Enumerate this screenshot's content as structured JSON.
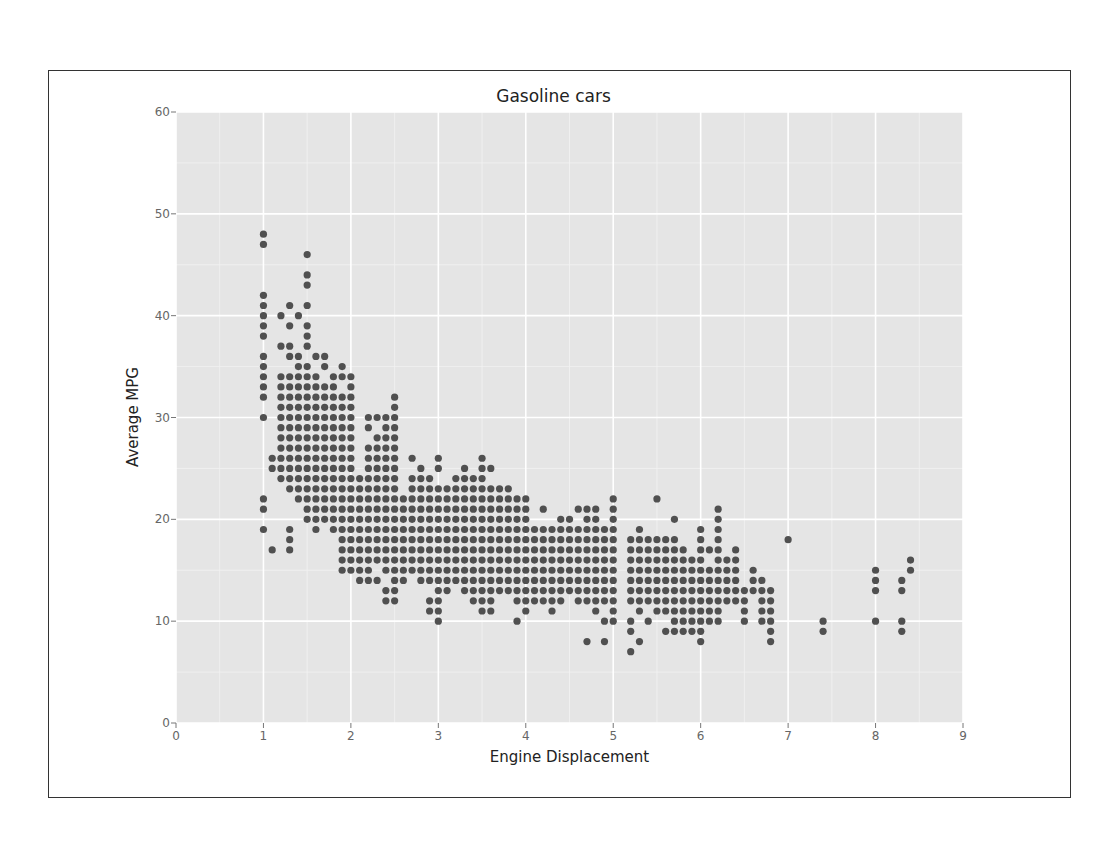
{
  "chart_data": {
    "type": "scatter",
    "title": "Gasoline cars",
    "xlabel": "Engine Displacement",
    "ylabel": "Average MPG",
    "xlim": [
      0,
      9
    ],
    "ylim": [
      0,
      60
    ],
    "xticks": [
      "0",
      "1",
      "2",
      "3",
      "4",
      "5",
      "6",
      "7",
      "8",
      "9"
    ],
    "yticks": [
      "0",
      "10",
      "20",
      "30",
      "40",
      "50",
      "60"
    ],
    "grid": true,
    "background": "#e5e5e5",
    "point_color": "#505050",
    "legend": null,
    "columns": [
      [
        1.0,
        [
          48,
          47,
          42,
          41,
          40,
          39,
          38,
          36,
          35,
          34,
          33,
          32,
          30,
          22,
          21,
          19
        ]
      ],
      [
        1.1,
        [
          26,
          25,
          17
        ]
      ],
      [
        1.2,
        [
          40,
          37,
          34,
          33,
          32,
          31,
          30,
          29,
          28,
          27,
          26,
          25,
          24
        ]
      ],
      [
        1.3,
        [
          41,
          39,
          37,
          36,
          34,
          33,
          32,
          31,
          30,
          29,
          28,
          27,
          26,
          25,
          24,
          23,
          19,
          18,
          17
        ]
      ],
      [
        1.4,
        [
          40,
          36,
          35,
          34,
          33,
          32,
          31,
          30,
          29,
          28,
          27,
          26,
          25,
          24,
          23,
          22
        ]
      ],
      [
        1.5,
        [
          46,
          44,
          43,
          41,
          39,
          38,
          37,
          35,
          34,
          33,
          32,
          31,
          30,
          29,
          28,
          27,
          26,
          25,
          24,
          23,
          22,
          21,
          20
        ]
      ],
      [
        1.6,
        [
          36,
          34,
          33,
          32,
          31,
          30,
          29,
          28,
          27,
          26,
          25,
          24,
          23,
          22,
          21,
          20,
          19
        ]
      ],
      [
        1.7,
        [
          36,
          35,
          33,
          32,
          31,
          30,
          29,
          28,
          27,
          26,
          25,
          24,
          23,
          22,
          21,
          20
        ]
      ],
      [
        1.8,
        [
          34,
          33,
          32,
          31,
          30,
          29,
          28,
          27,
          26,
          25,
          24,
          23,
          22,
          21,
          20,
          19
        ]
      ],
      [
        1.9,
        [
          35,
          34,
          32,
          31,
          30,
          29,
          28,
          27,
          26,
          25,
          24,
          23,
          22,
          21,
          20,
          19,
          18,
          17,
          16,
          15
        ]
      ],
      [
        2.0,
        [
          34,
          33,
          32,
          31,
          30,
          29,
          28,
          27,
          26,
          25,
          24,
          23,
          22,
          21,
          20,
          19,
          18,
          17,
          16,
          15
        ]
      ],
      [
        2.1,
        [
          24,
          23,
          22,
          21,
          20,
          19,
          18,
          17,
          16,
          15,
          14
        ]
      ],
      [
        2.2,
        [
          30,
          29,
          27,
          26,
          25,
          24,
          23,
          22,
          21,
          20,
          19,
          18,
          17,
          16,
          15,
          14
        ]
      ],
      [
        2.3,
        [
          30,
          28,
          27,
          26,
          25,
          24,
          23,
          22,
          21,
          20,
          19,
          18,
          17,
          16,
          14
        ]
      ],
      [
        2.4,
        [
          30,
          29,
          28,
          27,
          26,
          25,
          24,
          23,
          22,
          21,
          20,
          19,
          18,
          17,
          16,
          15,
          13,
          12
        ]
      ],
      [
        2.5,
        [
          32,
          31,
          30,
          29,
          28,
          27,
          26,
          25,
          24,
          23,
          22,
          21,
          20,
          19,
          18,
          17,
          16,
          15,
          14,
          13,
          12
        ]
      ],
      [
        2.6,
        [
          22,
          21,
          20,
          19,
          18,
          17,
          16,
          15,
          14
        ]
      ],
      [
        2.7,
        [
          26,
          24,
          23,
          22,
          21,
          20,
          19,
          18,
          17,
          16,
          15
        ]
      ],
      [
        2.8,
        [
          25,
          24,
          23,
          22,
          21,
          20,
          19,
          18,
          17,
          16,
          15,
          14
        ]
      ],
      [
        2.9,
        [
          24,
          23,
          22,
          21,
          20,
          19,
          18,
          17,
          16,
          15,
          14,
          12,
          11
        ]
      ],
      [
        3.0,
        [
          26,
          25,
          23,
          22,
          21,
          20,
          19,
          18,
          17,
          16,
          15,
          14,
          13,
          12,
          11,
          10
        ]
      ],
      [
        3.1,
        [
          23,
          22,
          21,
          20,
          19,
          18,
          17,
          16,
          15,
          14,
          13
        ]
      ],
      [
        3.2,
        [
          24,
          23,
          22,
          21,
          20,
          19,
          18,
          17,
          16,
          15,
          14
        ]
      ],
      [
        3.3,
        [
          25,
          24,
          23,
          22,
          21,
          20,
          19,
          18,
          17,
          16,
          15,
          14,
          13
        ]
      ],
      [
        3.4,
        [
          24,
          23,
          22,
          21,
          20,
          19,
          18,
          17,
          16,
          15,
          14,
          13,
          12
        ]
      ],
      [
        3.5,
        [
          26,
          25,
          24,
          23,
          22,
          21,
          20,
          19,
          18,
          17,
          16,
          15,
          14,
          13,
          12,
          11
        ]
      ],
      [
        3.6,
        [
          25,
          23,
          22,
          21,
          20,
          19,
          18,
          17,
          16,
          15,
          14,
          13,
          12,
          11
        ]
      ],
      [
        3.7,
        [
          23,
          22,
          21,
          20,
          19,
          18,
          17,
          16,
          15,
          14,
          13
        ]
      ],
      [
        3.8,
        [
          23,
          22,
          21,
          20,
          19,
          18,
          17,
          16,
          15,
          14,
          13
        ]
      ],
      [
        3.9,
        [
          22,
          21,
          20,
          19,
          18,
          17,
          16,
          15,
          14,
          13,
          12,
          10
        ]
      ],
      [
        4.0,
        [
          22,
          21,
          20,
          19,
          18,
          17,
          16,
          15,
          14,
          13,
          12,
          11
        ]
      ],
      [
        4.1,
        [
          19,
          18,
          17,
          16,
          15,
          14,
          13,
          12
        ]
      ],
      [
        4.2,
        [
          21,
          19,
          18,
          17,
          16,
          15,
          14,
          13,
          12
        ]
      ],
      [
        4.3,
        [
          19,
          18,
          17,
          16,
          15,
          14,
          13,
          12,
          11
        ]
      ],
      [
        4.4,
        [
          20,
          19,
          18,
          17,
          16,
          15,
          14,
          13,
          12
        ]
      ],
      [
        4.5,
        [
          20,
          19,
          18,
          17,
          16,
          15,
          14,
          13
        ]
      ],
      [
        4.6,
        [
          21,
          19,
          18,
          17,
          16,
          15,
          14,
          13,
          12
        ]
      ],
      [
        4.7,
        [
          21,
          20,
          19,
          18,
          17,
          16,
          15,
          14,
          13,
          12,
          8
        ]
      ],
      [
        4.8,
        [
          21,
          20,
          19,
          18,
          17,
          16,
          15,
          14,
          13,
          12,
          11
        ]
      ],
      [
        4.9,
        [
          19,
          18,
          17,
          16,
          15,
          14,
          13,
          12,
          10,
          8
        ]
      ],
      [
        5.0,
        [
          22,
          21,
          20,
          19,
          18,
          17,
          16,
          15,
          14,
          13,
          12,
          11,
          10
        ]
      ],
      [
        5.2,
        [
          18,
          17,
          16,
          15,
          14,
          13,
          12,
          10,
          9,
          7
        ]
      ],
      [
        5.3,
        [
          19,
          18,
          17,
          16,
          15,
          14,
          13,
          12,
          11,
          8
        ]
      ],
      [
        5.4,
        [
          18,
          17,
          16,
          15,
          14,
          13,
          12,
          10
        ]
      ],
      [
        5.5,
        [
          22,
          18,
          17,
          16,
          15,
          14,
          13,
          12,
          11
        ]
      ],
      [
        5.6,
        [
          18,
          17,
          16,
          15,
          14,
          13,
          12,
          11,
          9
        ]
      ],
      [
        5.7,
        [
          20,
          18,
          17,
          16,
          15,
          14,
          13,
          12,
          11,
          10,
          9
        ]
      ],
      [
        5.8,
        [
          17,
          16,
          15,
          14,
          13,
          12,
          11,
          10,
          9
        ]
      ],
      [
        5.9,
        [
          16,
          15,
          14,
          13,
          12,
          11,
          10,
          9
        ]
      ],
      [
        6.0,
        [
          19,
          18,
          17,
          16,
          15,
          14,
          13,
          12,
          11,
          10,
          9,
          8
        ]
      ],
      [
        6.1,
        [
          17,
          15,
          14,
          13,
          12,
          11,
          10
        ]
      ],
      [
        6.2,
        [
          21,
          20,
          19,
          18,
          17,
          16,
          15,
          14,
          13,
          12,
          11,
          10
        ]
      ],
      [
        6.3,
        [
          16,
          15,
          14,
          13,
          12
        ]
      ],
      [
        6.4,
        [
          17,
          16,
          15,
          14,
          13,
          12
        ]
      ],
      [
        6.5,
        [
          13,
          12,
          11,
          10
        ]
      ],
      [
        6.6,
        [
          15,
          14,
          13
        ]
      ],
      [
        6.7,
        [
          14,
          13,
          12,
          11,
          10
        ]
      ],
      [
        6.8,
        [
          13,
          12,
          11,
          10,
          9,
          8
        ]
      ],
      [
        7.0,
        [
          18
        ]
      ],
      [
        7.4,
        [
          10,
          9
        ]
      ],
      [
        8.0,
        [
          15,
          14,
          13,
          10
        ]
      ],
      [
        8.3,
        [
          14,
          13,
          10,
          9
        ]
      ],
      [
        8.4,
        [
          16,
          15
        ]
      ]
    ]
  }
}
